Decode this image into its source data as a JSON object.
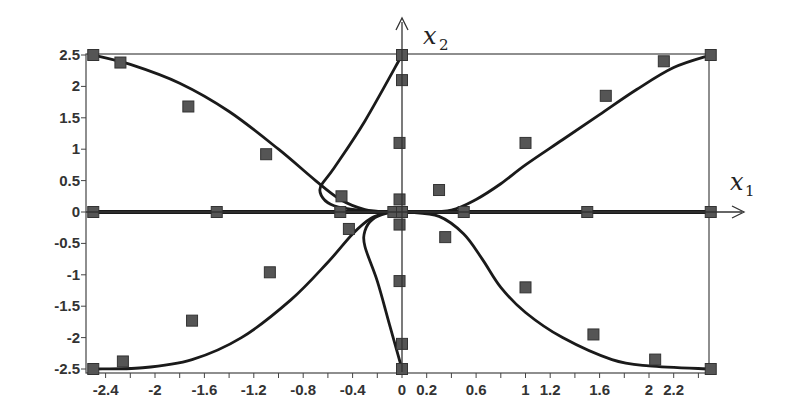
{
  "chart_data": {
    "type": "scatter",
    "title": "",
    "xlabel": "x1",
    "ylabel": "x2",
    "xlabel_parts": {
      "base": "x",
      "sub": "1"
    },
    "ylabel_parts": {
      "base": "x",
      "sub": "2"
    },
    "xlim": [
      -2.5,
      2.5
    ],
    "ylim": [
      -2.5,
      2.5
    ],
    "grid": false,
    "legend": null,
    "x_tick_labels": [
      "-2.4",
      "-2",
      "-1.6",
      "-1.2",
      "-0.8",
      "-0.4",
      "0",
      "0.2",
      "0.6",
      "1",
      "1.2",
      "1.6",
      "2",
      "2.2"
    ],
    "x_tick_values": [
      -2.4,
      -2.0,
      -1.6,
      -1.2,
      -0.8,
      -0.4,
      0,
      0.2,
      0.6,
      1.0,
      1.2,
      1.6,
      2.0,
      2.2
    ],
    "y_tick_labels": [
      "2.5",
      "2",
      "1.5",
      "1",
      "0.5",
      "0",
      "-0.5",
      "-1",
      "-1.5",
      "-2",
      "-2.5"
    ],
    "y_tick_values": [
      2.5,
      2.0,
      1.5,
      1.0,
      0.5,
      0,
      -0.5,
      -1.0,
      -1.5,
      -2.0,
      -2.5
    ],
    "colors": {
      "curve": "#1a1a1a",
      "marker": "#555555",
      "marker_edge": "#333333",
      "frame": "#444444"
    },
    "series": [
      {
        "name": "data-points",
        "kind": "markers",
        "marker": "square",
        "points": [
          [
            -2.5,
            2.5
          ],
          [
            -2.28,
            2.38
          ],
          [
            -1.73,
            1.68
          ],
          [
            -1.1,
            0.92
          ],
          [
            -0.49,
            0.25
          ],
          [
            -2.5,
            -2.5
          ],
          [
            -2.26,
            -2.38
          ],
          [
            -1.7,
            -1.73
          ],
          [
            -1.07,
            -0.96
          ],
          [
            -0.43,
            -0.27
          ],
          [
            0.3,
            0.35
          ],
          [
            1.0,
            1.1
          ],
          [
            1.65,
            1.85
          ],
          [
            2.12,
            2.4
          ],
          [
            2.5,
            2.5
          ],
          [
            0.35,
            -0.4
          ],
          [
            1.0,
            -1.2
          ],
          [
            1.55,
            -1.95
          ],
          [
            2.05,
            -2.35
          ],
          [
            2.5,
            -2.5
          ],
          [
            0.0,
            2.5
          ],
          [
            0.0,
            2.1
          ],
          [
            -0.02,
            1.1
          ],
          [
            -0.02,
            0.2
          ],
          [
            -0.02,
            -0.2
          ],
          [
            -0.02,
            -1.1
          ],
          [
            0.0,
            -2.1
          ],
          [
            0.0,
            -2.5
          ],
          [
            -2.5,
            0.0
          ],
          [
            -1.5,
            0.0
          ],
          [
            -0.5,
            0.0
          ],
          [
            -0.07,
            0.0
          ],
          [
            0.0,
            0.0
          ],
          [
            0.5,
            0.0
          ],
          [
            1.5,
            0.0
          ],
          [
            2.5,
            0.0
          ]
        ]
      },
      {
        "name": "curve-upper-left",
        "kind": "line",
        "points": [
          [
            -2.5,
            2.5
          ],
          [
            -2.2,
            2.35
          ],
          [
            -1.8,
            2.05
          ],
          [
            -1.4,
            1.6
          ],
          [
            -1.0,
            1.0
          ],
          [
            -0.7,
            0.5
          ],
          [
            -0.5,
            0.2
          ],
          [
            -0.3,
            0.04
          ],
          [
            -0.1,
            0.0
          ]
        ]
      },
      {
        "name": "curve-lower-left",
        "kind": "line",
        "points": [
          [
            -2.5,
            -2.5
          ],
          [
            -2.1,
            -2.48
          ],
          [
            -1.7,
            -2.35
          ],
          [
            -1.3,
            -2.0
          ],
          [
            -0.9,
            -1.4
          ],
          [
            -0.6,
            -0.8
          ],
          [
            -0.4,
            -0.35
          ],
          [
            -0.25,
            -0.1
          ],
          [
            -0.1,
            0.0
          ]
        ]
      },
      {
        "name": "curve-upper-right",
        "kind": "line",
        "points": [
          [
            0.15,
            0.0
          ],
          [
            0.4,
            0.03
          ],
          [
            0.6,
            0.2
          ],
          [
            0.8,
            0.45
          ],
          [
            1.0,
            0.75
          ],
          [
            1.3,
            1.15
          ],
          [
            1.6,
            1.55
          ],
          [
            1.9,
            1.95
          ],
          [
            2.2,
            2.3
          ],
          [
            2.5,
            2.5
          ]
        ]
      },
      {
        "name": "curve-lower-right",
        "kind": "line",
        "points": [
          [
            0.05,
            0.0
          ],
          [
            0.3,
            -0.07
          ],
          [
            0.5,
            -0.35
          ],
          [
            0.65,
            -0.75
          ],
          [
            0.8,
            -1.2
          ],
          [
            1.0,
            -1.6
          ],
          [
            1.3,
            -2.0
          ],
          [
            1.7,
            -2.35
          ],
          [
            2.0,
            -2.45
          ],
          [
            2.5,
            -2.5
          ]
        ]
      },
      {
        "name": "curve-upper-loop",
        "kind": "line",
        "points": [
          [
            0.0,
            2.5
          ],
          [
            -0.3,
            1.45
          ],
          [
            -0.55,
            0.7
          ],
          [
            -0.66,
            0.4
          ],
          [
            -0.64,
            0.22
          ],
          [
            -0.55,
            0.1
          ],
          [
            -0.35,
            0.03
          ],
          [
            -0.1,
            0.0
          ],
          [
            0.0,
            0.0
          ]
        ]
      },
      {
        "name": "curve-lower-loop",
        "kind": "line",
        "points": [
          [
            0.0,
            -2.5
          ],
          [
            -0.1,
            -1.8
          ],
          [
            -0.2,
            -1.1
          ],
          [
            -0.3,
            -0.55
          ],
          [
            -0.3,
            -0.3
          ],
          [
            -0.24,
            -0.12
          ],
          [
            -0.12,
            -0.02
          ],
          [
            0.0,
            0.0
          ]
        ]
      },
      {
        "name": "x1-axis-line",
        "kind": "line",
        "points": [
          [
            -2.5,
            0.0
          ],
          [
            2.5,
            0.0
          ]
        ]
      }
    ]
  }
}
